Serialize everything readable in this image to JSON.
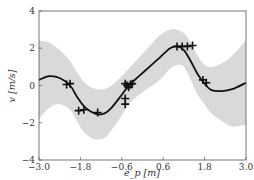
{
  "chart_data": {
    "type": "line",
    "title": "",
    "xlabel": "e_p [m]",
    "ylabel": "v [m/s]",
    "xlim": [
      -3.0,
      3.0
    ],
    "ylim": [
      -4,
      4
    ],
    "xticks": [
      "-3.0",
      "-1.8",
      "-0.6",
      "0.6",
      "1.8",
      "3.0"
    ],
    "yticks": [
      "-4",
      "-2",
      "0",
      "2",
      "4"
    ],
    "grid": false,
    "legend": null,
    "colors": {
      "mean": "#111111",
      "band": "#d9d9d9",
      "points": "#111111"
    },
    "series": [
      {
        "name": "GP mean",
        "kind": "line",
        "x": [
          -3.0,
          -2.7,
          -2.4,
          -2.1,
          -1.9,
          -1.7,
          -1.5,
          -1.3,
          -1.1,
          -0.9,
          -0.6,
          -0.4,
          -0.1,
          0.2,
          0.5,
          0.8,
          1.0,
          1.2,
          1.4,
          1.6,
          1.8,
          2.0,
          2.3,
          2.6,
          3.0
        ],
        "values": [
          0.3,
          0.5,
          0.4,
          0.0,
          -0.6,
          -1.1,
          -1.4,
          -1.55,
          -1.5,
          -1.2,
          -0.5,
          0.0,
          0.5,
          1.0,
          1.5,
          2.0,
          2.1,
          1.9,
          1.3,
          0.6,
          0.1,
          -0.25,
          -0.3,
          -0.2,
          0.15
        ]
      },
      {
        "name": "GP confidence band upper",
        "kind": "band_upper",
        "x": [
          -3.0,
          -2.7,
          -2.4,
          -2.1,
          -1.9,
          -1.7,
          -1.5,
          -1.3,
          -1.1,
          -0.9,
          -0.6,
          -0.4,
          -0.1,
          0.2,
          0.5,
          0.8,
          1.0,
          1.2,
          1.4,
          1.6,
          1.8,
          2.0,
          2.3,
          2.6,
          3.0
        ],
        "values": [
          2.4,
          2.3,
          1.9,
          1.3,
          0.7,
          0.2,
          -0.1,
          -0.2,
          -0.2,
          0.0,
          0.5,
          0.9,
          1.5,
          2.1,
          2.7,
          3.0,
          3.0,
          2.8,
          2.3,
          1.6,
          1.1,
          1.0,
          1.2,
          1.6,
          2.4
        ]
      },
      {
        "name": "GP confidence band lower",
        "kind": "band_lower",
        "x": [
          -3.0,
          -2.7,
          -2.4,
          -2.1,
          -1.9,
          -1.7,
          -1.5,
          -1.3,
          -1.1,
          -0.9,
          -0.6,
          -0.4,
          -0.1,
          0.2,
          0.5,
          0.8,
          1.0,
          1.2,
          1.4,
          1.6,
          1.8,
          2.0,
          2.3,
          2.6,
          3.0
        ],
        "values": [
          -1.8,
          -1.2,
          -1.0,
          -1.3,
          -1.9,
          -2.5,
          -2.8,
          -2.9,
          -2.8,
          -2.4,
          -1.6,
          -1.0,
          -0.5,
          -0.1,
          0.3,
          0.9,
          1.1,
          1.0,
          0.3,
          -0.5,
          -1.0,
          -1.5,
          -1.9,
          -2.2,
          -2.1
        ]
      },
      {
        "name": "Observations",
        "kind": "scatter",
        "marker": "+",
        "x": [
          -2.2,
          -2.1,
          -1.85,
          -1.7,
          -1.3,
          -0.5,
          -0.45,
          -0.4,
          -0.35,
          -0.3,
          -0.5,
          -0.5,
          1.0,
          1.15,
          1.3,
          1.45,
          1.75,
          1.85
        ],
        "values": [
          0.05,
          0.1,
          -1.35,
          -1.3,
          -1.45,
          0.1,
          0.0,
          -0.1,
          0.05,
          0.1,
          -0.7,
          -1.0,
          2.1,
          2.1,
          2.1,
          2.15,
          0.3,
          0.15
        ]
      }
    ]
  }
}
